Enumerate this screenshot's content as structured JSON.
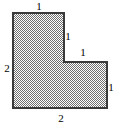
{
  "figure": {
    "shape_type": "l-shaped-polygon",
    "fill_pattern": "checkerboard-dither-gray",
    "fill_color": "#8c8c8c",
    "fill_background": "#ffffff",
    "border_color": "#3a3a3a",
    "border_width": 1.6,
    "canvas": {
      "width": 119,
      "height": 130
    },
    "vertices": [
      {
        "x": 13,
        "y": 13
      },
      {
        "x": 64,
        "y": 13
      },
      {
        "x": 64,
        "y": 62
      },
      {
        "x": 107,
        "y": 62
      },
      {
        "x": 107,
        "y": 108
      },
      {
        "x": 13,
        "y": 108
      }
    ],
    "labels": [
      {
        "name": "top-edge-label",
        "text": "1",
        "edge": "top",
        "position": "above"
      },
      {
        "name": "upper-right-edge-label",
        "text": "1",
        "edge": "upper-vertical",
        "position": "right"
      },
      {
        "name": "step-edge-label",
        "text": "1",
        "edge": "notch-horizontal",
        "position": "above"
      },
      {
        "name": "right-edge-label",
        "text": "1",
        "edge": "right-vertical",
        "position": "right"
      },
      {
        "name": "left-edge-label",
        "text": "2",
        "edge": "left-vertical",
        "position": "left"
      },
      {
        "name": "bottom-edge-label",
        "text": "2",
        "edge": "bottom",
        "position": "below"
      }
    ]
  }
}
